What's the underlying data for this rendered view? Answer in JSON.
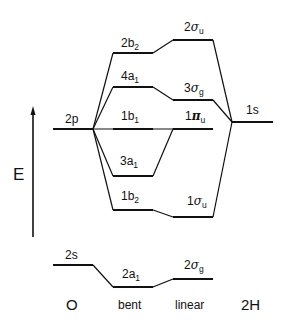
{
  "diagram": {
    "axis": {
      "label": "E",
      "direction": "up"
    },
    "columns": {
      "left": "O",
      "bent": "bent",
      "linear": "linear",
      "right": "2H"
    },
    "atomic_orbitals": {
      "O_2p": {
        "label": "2p"
      },
      "O_2s": {
        "label": "2s"
      },
      "H_1s": {
        "label": "1s"
      }
    },
    "correlations": [
      {
        "bent": {
          "main": "2b",
          "sub": "2"
        },
        "linear": {
          "main": "2",
          "greek": "σ",
          "sub": "u"
        }
      },
      {
        "bent": {
          "main": "4a",
          "sub": "1"
        },
        "linear": {
          "main": "3",
          "greek": "σ",
          "sub": "g"
        }
      },
      {
        "bent": {
          "main": "1b",
          "sub": "1"
        },
        "linear": {
          "main": "1",
          "greek": "π",
          "sub": "u"
        }
      },
      {
        "bent": {
          "main": "3a",
          "sub": "1"
        },
        "linear": {
          "main": "1",
          "greek": "π",
          "sub": "u"
        }
      },
      {
        "bent": {
          "main": "1b",
          "sub": "2"
        },
        "linear": {
          "main": "1",
          "greek": "σ",
          "sub": "u"
        }
      },
      {
        "bent": {
          "main": "2a",
          "sub": "1"
        },
        "linear": {
          "main": "2",
          "greek": "σ",
          "sub": "g"
        }
      }
    ]
  }
}
